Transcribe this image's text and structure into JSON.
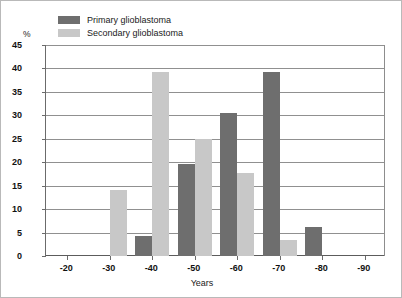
{
  "chart_data": {
    "type": "bar",
    "title": "",
    "xlabel": "Years",
    "ylabel": "%",
    "ylim": [
      0,
      45
    ],
    "yticks": [
      0,
      5,
      10,
      15,
      20,
      25,
      30,
      35,
      40,
      45
    ],
    "grid": true,
    "legend_position": "top-left",
    "categories": [
      "-20",
      "-30",
      "-40",
      "-50",
      "-60",
      "-70",
      "-80",
      "-90"
    ],
    "series": [
      {
        "name": "Primary glioblastoma",
        "color": "#6e6e6e",
        "values": [
          0,
          0,
          4.2,
          19.6,
          30.5,
          39.2,
          6.3,
          0
        ]
      },
      {
        "name": "Secondary glioblastoma",
        "color": "#c8c8c8",
        "values": [
          0,
          14.1,
          39.3,
          25.0,
          17.8,
          3.5,
          0,
          0
        ]
      }
    ]
  },
  "legend": {
    "items": [
      {
        "label": "Primary glioblastoma",
        "color": "#6e6e6e"
      },
      {
        "label": "Secondary glioblastoma",
        "color": "#c8c8c8"
      }
    ]
  },
  "axes": {
    "y_unit": "%",
    "x_title": "Years"
  }
}
